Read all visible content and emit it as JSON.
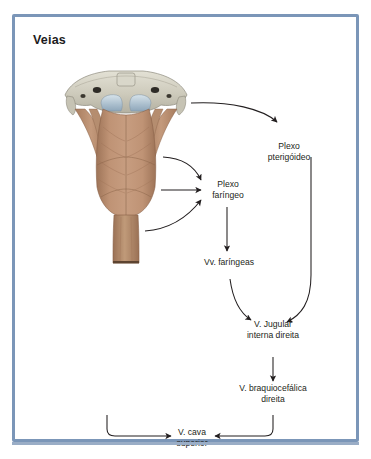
{
  "panel": {
    "title": "Veias",
    "border_color": "#7b96b8",
    "background": "#ffffff"
  },
  "illustration": {
    "name": "pharynx-posterior-view",
    "description": "Vista posterior da faringe com base do crânio",
    "bone_color": "#cfccbc",
    "muscle_color": "#b6896c",
    "mucosa_color": "#b9c9d6"
  },
  "flowchart": {
    "nodes": [
      {
        "id": "plexo_pterigoideo",
        "line1": "Plexo",
        "line2": "pterigóideo"
      },
      {
        "id": "plexo_faringeo",
        "line1": "Plexo",
        "line2": "faríngeo"
      },
      {
        "id": "vv_faringeas",
        "line1": "Vv. faríngeas",
        "line2": ""
      },
      {
        "id": "v_jugular",
        "line1": "V. Jugular",
        "line2": "interna direita"
      },
      {
        "id": "v_braquiocefalica",
        "line1": "V. braquiocefálica",
        "line2": "direita"
      },
      {
        "id": "v_cava",
        "line1": "V. cava",
        "line2": "superior"
      }
    ],
    "arrow_color": "#231f20"
  }
}
